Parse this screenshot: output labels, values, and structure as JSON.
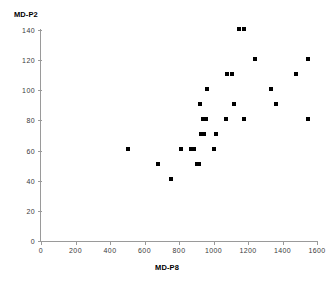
{
  "chart_data": {
    "type": "scatter",
    "title": "",
    "xlabel": "MD-P8",
    "ylabel": "MD-P2",
    "xlim": [
      0,
      1600
    ],
    "ylim": [
      0,
      140
    ],
    "xticks": [
      0,
      200,
      400,
      600,
      800,
      1000,
      1200,
      1400,
      1600
    ],
    "yticks": [
      0,
      20,
      40,
      60,
      80,
      100,
      120,
      140
    ],
    "xtick_labels": [
      "0",
      "200",
      "400",
      "600",
      "800",
      "1000",
      "1200",
      "1400",
      "1600"
    ],
    "ytick_labels": [
      "0",
      "20",
      "40",
      "60",
      "80",
      "100",
      "120",
      "140"
    ],
    "grid": false,
    "legend": null,
    "marker": "square",
    "marker_color": "#000000",
    "points": [
      {
        "x": 505,
        "y": 61
      },
      {
        "x": 680,
        "y": 51
      },
      {
        "x": 755,
        "y": 41
      },
      {
        "x": 810,
        "y": 61
      },
      {
        "x": 870,
        "y": 61
      },
      {
        "x": 885,
        "y": 61
      },
      {
        "x": 905,
        "y": 51
      },
      {
        "x": 915,
        "y": 51
      },
      {
        "x": 920,
        "y": 91
      },
      {
        "x": 930,
        "y": 71
      },
      {
        "x": 945,
        "y": 71
      },
      {
        "x": 940,
        "y": 81
      },
      {
        "x": 955,
        "y": 81
      },
      {
        "x": 960,
        "y": 101
      },
      {
        "x": 1000,
        "y": 61
      },
      {
        "x": 1015,
        "y": 71
      },
      {
        "x": 1075,
        "y": 81
      },
      {
        "x": 1080,
        "y": 111
      },
      {
        "x": 1110,
        "y": 111
      },
      {
        "x": 1120,
        "y": 91
      },
      {
        "x": 1150,
        "y": 141
      },
      {
        "x": 1175,
        "y": 141
      },
      {
        "x": 1175,
        "y": 81
      },
      {
        "x": 1240,
        "y": 121
      },
      {
        "x": 1335,
        "y": 101
      },
      {
        "x": 1360,
        "y": 91
      },
      {
        "x": 1480,
        "y": 111
      },
      {
        "x": 1545,
        "y": 121
      },
      {
        "x": 1550,
        "y": 81
      }
    ]
  },
  "axes": {
    "y_title": "MD-P2",
    "x_title": "MD-P8"
  }
}
